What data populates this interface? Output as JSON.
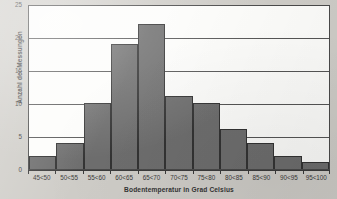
{
  "chart_data": {
    "type": "bar",
    "title": "",
    "subtitle": "",
    "xlabel": "Bodentemperatur in Grad Celsius",
    "ylabel": "Anzahl der Messungen",
    "categories": [
      "45<50",
      "50<55",
      "55<60",
      "60<65",
      "65<70",
      "70<75",
      "75<80",
      "80<85",
      "85<90",
      "90<95",
      "95<100"
    ],
    "values": [
      2,
      4,
      10,
      19,
      22,
      11,
      10,
      6,
      4,
      2,
      1
    ],
    "ylim": [
      0,
      25
    ],
    "yticks": [
      0,
      5,
      10,
      15,
      20,
      25
    ],
    "ytick_labels": [
      "0",
      "5",
      "10",
      "15",
      "20",
      "25"
    ],
    "grid": true,
    "grid_axis": "y",
    "legend": false,
    "legend_position": "none",
    "bar_color": "#6e6e6e",
    "bar_edge_color": "#333333",
    "plot_background": "#fdfdfb",
    "page_background": "#cfcdc8",
    "axis_color": "#4a4a4a",
    "gridline_color": "#555555"
  }
}
